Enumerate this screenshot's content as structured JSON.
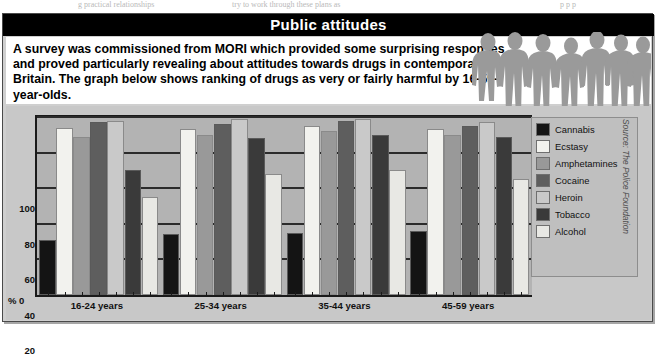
{
  "bleed_text": [
    {
      "text": "g practical relationships",
      "left": 78
    },
    {
      "text": "try to work through these plans as",
      "left": 232
    },
    {
      "text": "p       p       p",
      "left": 560
    }
  ],
  "header": {
    "title": "Public attitudes"
  },
  "intro": {
    "body": "A survey was commissioned from MORI which provided some surprising responses and proved particularly revealing about attitudes towards drugs in contemporary Britain. The graph below shows ranking of drugs as very or fairly harmful by 16-59-year-olds."
  },
  "source_credit": "Source: The Police Foundation",
  "legend": {
    "items": [
      {
        "label": "Cannabis",
        "color": "#141414"
      },
      {
        "label": "Ecstasy",
        "color": "#f2f2ee"
      },
      {
        "label": "Amphetamines",
        "color": "#999999"
      },
      {
        "label": "Cocaine",
        "color": "#5e5e5e"
      },
      {
        "label": "Heroin",
        "color": "#c9c9c9"
      },
      {
        "label": "Tobacco",
        "color": "#3a3a3a"
      },
      {
        "label": "Alcohol",
        "color": "#e8e8e4"
      }
    ]
  },
  "chart_data": {
    "type": "bar",
    "xlabel": "",
    "ylabel": "%",
    "ylim": [
      0,
      100
    ],
    "yticks": [
      0,
      20,
      40,
      60,
      80,
      100
    ],
    "ytick_labels": [
      "0",
      "20",
      "40",
      "60",
      "80",
      "100"
    ],
    "y_zero_label": "% 0",
    "grid": true,
    "legend_position": "right",
    "categories": [
      "16-24 years",
      "25-34 years",
      "35-44 years",
      "45-59 years"
    ],
    "series": [
      {
        "name": "Cannabis",
        "color": "#141414",
        "values": [
          31,
          34,
          35,
          36
        ]
      },
      {
        "name": "Ecstasy",
        "color": "#f2f2ee",
        "values": [
          94,
          93,
          95,
          93
        ]
      },
      {
        "name": "Amphetamines",
        "color": "#999999",
        "values": [
          89,
          90,
          92,
          90
        ]
      },
      {
        "name": "Cocaine",
        "color": "#5e5e5e",
        "values": [
          97,
          96,
          98,
          95
        ]
      },
      {
        "name": "Heroin",
        "color": "#c9c9c9",
        "values": [
          98,
          99,
          99,
          97
        ]
      },
      {
        "name": "Tobacco",
        "color": "#3a3a3a",
        "values": [
          70,
          88,
          90,
          89
        ]
      },
      {
        "name": "Alcohol",
        "color": "#e8e8e4",
        "values": [
          55,
          68,
          70,
          65
        ]
      }
    ]
  }
}
